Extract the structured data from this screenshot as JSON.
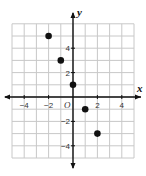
{
  "chart_data": {
    "type": "scatter",
    "title": "",
    "xlabel": "x",
    "ylabel": "y",
    "origin_label": "O",
    "xlim": [
      -5,
      5
    ],
    "ylim": [
      -5,
      6
    ],
    "grid": true,
    "x_ticks": [
      -4,
      -2,
      2,
      4
    ],
    "y_ticks": [
      4,
      2,
      -2,
      -4
    ],
    "x_tick_labels": [
      "−4",
      "−2",
      "2",
      "4"
    ],
    "y_tick_labels": [
      "4",
      "2",
      "−2",
      "−4"
    ],
    "points": [
      {
        "x": -2,
        "y": 5
      },
      {
        "x": -1,
        "y": 3
      },
      {
        "x": 0,
        "y": 1
      },
      {
        "x": 1,
        "y": -1
      },
      {
        "x": 2,
        "y": -3
      }
    ],
    "colors": {
      "grid": "#c8c8c8",
      "axis": "#111111",
      "point": "#111111"
    }
  },
  "layout": {
    "origin_px": [
      73,
      97
    ],
    "unit_px": 12.2
  }
}
